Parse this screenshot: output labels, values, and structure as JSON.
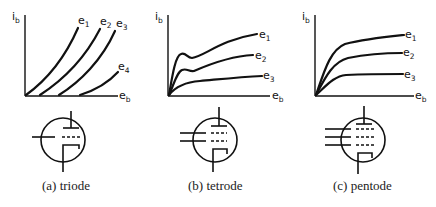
{
  "figure": {
    "panels": [
      {
        "id": "triode",
        "caption": "(a)  triode",
        "y_axis_label": {
          "main": "i",
          "sub": "b"
        },
        "x_axis_label": {
          "main": "e",
          "sub": "b"
        },
        "curves": [
          {
            "label": {
              "main": "e",
              "sub": "1"
            }
          },
          {
            "label": {
              "main": "e",
              "sub": "2"
            }
          },
          {
            "label": {
              "main": "e",
              "sub": "3"
            }
          },
          {
            "label": {
              "main": "e",
              "sub": "4"
            }
          }
        ],
        "grids": 1
      },
      {
        "id": "tetrode",
        "caption": "(b)  tetrode",
        "y_axis_label": {
          "main": "i",
          "sub": "b"
        },
        "x_axis_label": {
          "main": "e",
          "sub": "b"
        },
        "curves": [
          {
            "label": {
              "main": "e",
              "sub": "1"
            }
          },
          {
            "label": {
              "main": "e",
              "sub": "2"
            }
          },
          {
            "label": {
              "main": "e",
              "sub": "3"
            }
          }
        ],
        "grids": 2
      },
      {
        "id": "pentode",
        "caption": "(c)  pentode",
        "y_axis_label": {
          "main": "i",
          "sub": "b"
        },
        "x_axis_label": {
          "main": "e",
          "sub": "b"
        },
        "curves": [
          {
            "label": {
              "main": "e",
              "sub": "1"
            }
          },
          {
            "label": {
              "main": "e",
              "sub": "2"
            }
          },
          {
            "label": {
              "main": "e",
              "sub": "3"
            }
          }
        ],
        "grids": 3
      }
    ]
  }
}
